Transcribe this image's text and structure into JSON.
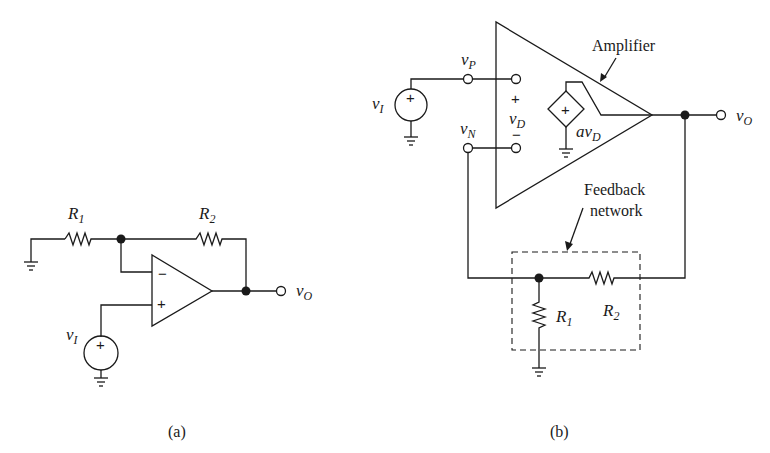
{
  "figure_a": {
    "caption": "(a)",
    "labels": {
      "r1": "R",
      "r1_sub": "1",
      "r2": "R",
      "r2_sub": "2",
      "vi": "v",
      "vi_sub": "I",
      "vo": "v",
      "vo_sub": "O",
      "minus": "−",
      "plus": "+",
      "source_plus": "+"
    }
  },
  "figure_b": {
    "caption": "(b)",
    "labels": {
      "vp": "v",
      "vp_sub": "P",
      "vn": "v",
      "vn_sub": "N",
      "vi": "v",
      "vi_sub": "I",
      "vd": "v",
      "vd_sub": "D",
      "vd_plus": "+",
      "vd_minus": "−",
      "avd": "av",
      "avd_sub": "D",
      "vo": "v",
      "vo_sub": "O",
      "amplifier": "Amplifier",
      "feedback_line1": "Feedback",
      "feedback_line2": "network",
      "r1": "R",
      "r1_sub": "1",
      "r2": "R",
      "r2_sub": "2",
      "source_plus": "+",
      "dep_plus": "+"
    }
  }
}
